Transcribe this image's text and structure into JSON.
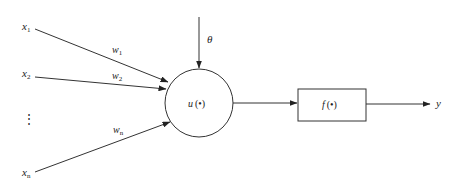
{
  "diagram": {
    "inputs": [
      {
        "name": "x",
        "sub": "1",
        "weight": "w",
        "weight_sub": "1"
      },
      {
        "name": "x",
        "sub": "2",
        "weight": "w",
        "weight_sub": "2"
      },
      {
        "name": "x",
        "sub": "n",
        "weight": "w",
        "weight_sub": "n"
      }
    ],
    "ellipsis": "⋮",
    "threshold": "θ",
    "summation": {
      "func": "u",
      "arg": "(•)"
    },
    "activation": {
      "func": "f",
      "arg": "(•)"
    },
    "output": "y",
    "colors": {
      "stroke": "#333333",
      "text": "#222222",
      "background": "#ffffff"
    }
  }
}
